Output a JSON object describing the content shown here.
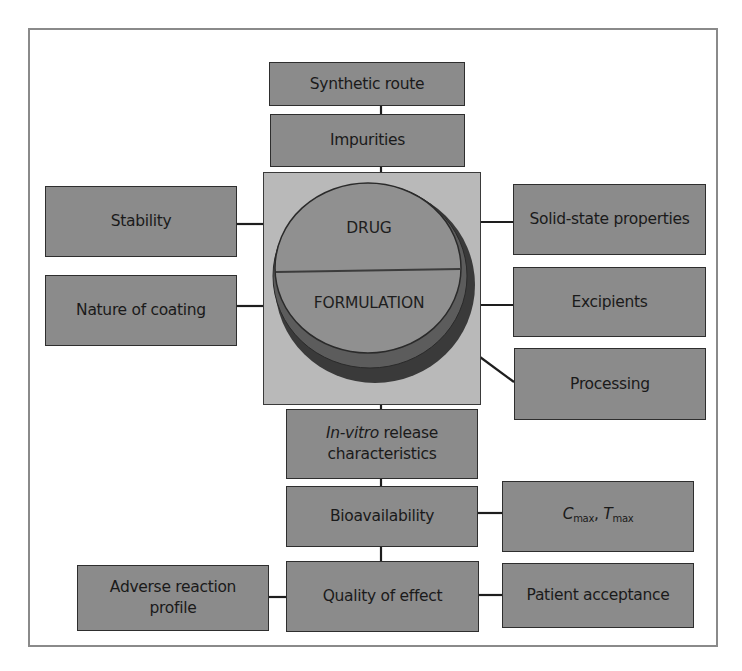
{
  "diagram": {
    "center": {
      "top_label": "DRUG",
      "bottom_label": "FORMULATION"
    },
    "top_chain": [
      {
        "id": "synthetic-route",
        "label": "Synthetic route"
      },
      {
        "id": "impurities",
        "label": "Impurities"
      }
    ],
    "left_factors": [
      {
        "id": "stability",
        "label": "Stability"
      },
      {
        "id": "nature-of-coating",
        "label": "Nature of coating"
      }
    ],
    "right_factors": [
      {
        "id": "solid-state-properties",
        "label": "Solid-state properties"
      },
      {
        "id": "excipients",
        "label": "Excipients"
      },
      {
        "id": "processing",
        "label": "Processing"
      }
    ],
    "bottom_chain": [
      {
        "id": "in-vitro-release",
        "label_italic": "In-vitro",
        "label_rest": " release",
        "label_line2": "characteristics"
      },
      {
        "id": "bioavailability",
        "label": "Bioavailability"
      },
      {
        "id": "quality-of-effect",
        "label": "Quality of effect"
      }
    ],
    "bioavailability_outcome": {
      "c_symbol": "C",
      "c_sub": "max",
      "separator": ", ",
      "t_symbol": "T",
      "t_sub": "max"
    },
    "quality_left": {
      "id": "adverse-reaction-profile",
      "label_line1": "Adverse reaction",
      "label_line2": "profile"
    },
    "quality_right": {
      "id": "patient-acceptance",
      "label": "Patient acceptance"
    },
    "colors": {
      "box_fill": "#8b8b8b",
      "container_fill": "#b9b9b9",
      "pill_face": "#8f8f8f",
      "pill_rim_inner": "#5a5a5a",
      "pill_rim_outer": "#3a3a3a",
      "text": "#1a1a1a"
    }
  }
}
